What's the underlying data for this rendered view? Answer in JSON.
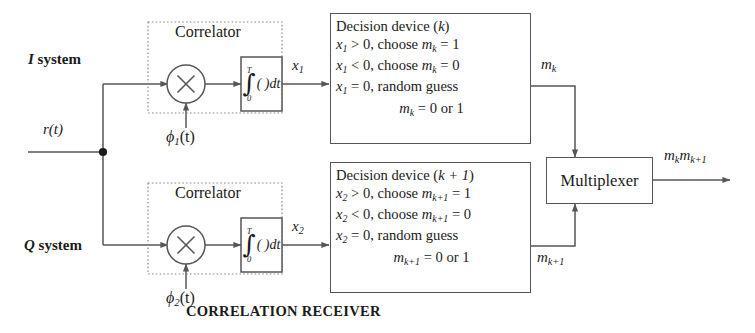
{
  "diagram": {
    "caption": "CORRELATION RECEIVER",
    "input_signal": "r(t)",
    "branches": [
      {
        "system_label_var": "I",
        "system_label_word": "system",
        "correlator_title": "Correlator",
        "local_carrier": "ϕ",
        "local_carrier_index": "1",
        "local_carrier_arg": "(t)",
        "integrator": {
          "sign": "∫",
          "upper_limit": "T",
          "lower_limit": "0",
          "argument": "( )dt"
        },
        "output_var": "x",
        "output_index": "1",
        "decision": {
          "title_prefix": "Decision device (",
          "title_index": "k",
          "title_suffix": ")",
          "lines": [
            {
              "var": "x",
              "vsub": "1",
              "cond": " > 0, choose ",
              "out": "m",
              "osub": "k",
              "val": " = 1"
            },
            {
              "var": "x",
              "vsub": "1",
              "cond": " < 0, choose ",
              "out": "m",
              "osub": "k",
              "val": " = 0"
            },
            {
              "var": "x",
              "vsub": "1",
              "cond": " = 0, random guess",
              "out": "",
              "osub": "",
              "val": ""
            }
          ],
          "last_line": {
            "out": "m",
            "osub": "k",
            "val": " = 0 or 1"
          }
        },
        "bit_label": "m",
        "bit_index": "k"
      },
      {
        "system_label_var": "Q",
        "system_label_word": "system",
        "correlator_title": "Correlator",
        "local_carrier": "ϕ",
        "local_carrier_index": "2",
        "local_carrier_arg": "(t)",
        "integrator": {
          "sign": "∫",
          "upper_limit": "T",
          "lower_limit": "0",
          "argument": "( )dt"
        },
        "output_var": "x",
        "output_index": "2",
        "decision": {
          "title_prefix": "Decision device (",
          "title_index": "k + 1",
          "title_suffix": ")",
          "lines": [
            {
              "var": "x",
              "vsub": "2",
              "cond": " > 0, choose ",
              "out": "m",
              "osub": "k+1",
              "val": " = 1"
            },
            {
              "var": "x",
              "vsub": "2",
              "cond": " < 0, choose ",
              "out": "m",
              "osub": "k+1",
              "val": " = 0"
            },
            {
              "var": "x",
              "vsub": "2",
              "cond": " = 0, random guess",
              "out": "",
              "osub": "",
              "val": ""
            }
          ],
          "last_line": {
            "out": "m",
            "osub": "k+1",
            "val": " = 0 or 1"
          }
        },
        "bit_label": "m",
        "bit_index": "k+1"
      }
    ],
    "multiplexer": {
      "label": "Multiplexer"
    },
    "output": {
      "first": "m",
      "first_sub": "k",
      "second": "m",
      "second_sub": "k+1"
    },
    "multiplier_glyph": "×",
    "colors": {
      "line": "#55565a",
      "dotted": "#8a8a8e",
      "text": "#1a1a1a"
    }
  }
}
